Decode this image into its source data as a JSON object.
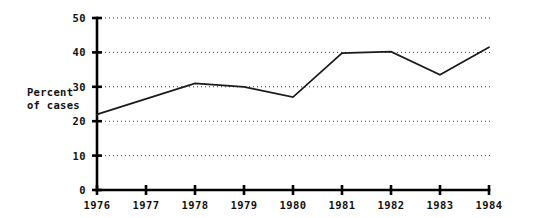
{
  "chart_data": {
    "type": "line",
    "title": "",
    "xlabel": "",
    "ylabel": "Percent of cases",
    "ylabel_line1": "Percent",
    "ylabel_line2": "of cases",
    "categories": [
      "1976",
      "1977",
      "1978",
      "1979",
      "1980",
      "1981",
      "1982",
      "1983",
      "1984"
    ],
    "x": [
      1976,
      1977,
      1978,
      1979,
      1980,
      1981,
      1982,
      1983,
      1984
    ],
    "values": [
      22,
      26.5,
      31,
      30,
      27,
      39.8,
      40.2,
      33.5,
      41.5
    ],
    "series": [
      {
        "name": "Percent of cases",
        "values": [
          22,
          26.5,
          31,
          30,
          27,
          39.8,
          40.2,
          33.5,
          41.5
        ]
      }
    ],
    "ylim": [
      0,
      50
    ],
    "yticks": [
      0,
      10,
      20,
      30,
      40,
      50
    ],
    "ytick_labels": [
      "0",
      "10",
      "20",
      "30",
      "40",
      "50"
    ],
    "xtick_labels": [
      "1976",
      "1977",
      "1978",
      "1979",
      "1980",
      "1981",
      "1982",
      "1983",
      "1984"
    ],
    "grid": true,
    "grid_style": "dotted",
    "grid_axis": "y",
    "legend": false,
    "legend_position": "none",
    "line_color": "#1a1a1a",
    "axis_color": "#000000",
    "grid_color": "#3a3a3a",
    "background_color": "#ffffff",
    "markers": false
  },
  "geometry": {
    "plot_left": 97,
    "plot_right": 489,
    "plot_top": 18,
    "plot_bottom": 190,
    "ylabel_x": 27,
    "ylabel_y1": 96,
    "ylabel_y2": 109
  }
}
